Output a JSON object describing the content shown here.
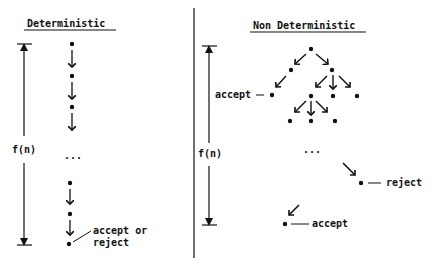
{
  "left_panel": {
    "title": "Deterministic",
    "axis_label": "f(n)",
    "ellipsis": "...",
    "end_label_line1": "accept or",
    "end_label_line2": "reject"
  },
  "right_panel": {
    "title": "Non Deterministic",
    "axis_label": "f(n)",
    "ellipsis": "...",
    "accept_label_upper": "accept",
    "reject_label": "reject",
    "accept_label_lower": "accept"
  },
  "colors": {
    "ink": "#111111",
    "background": "#ffffff"
  }
}
